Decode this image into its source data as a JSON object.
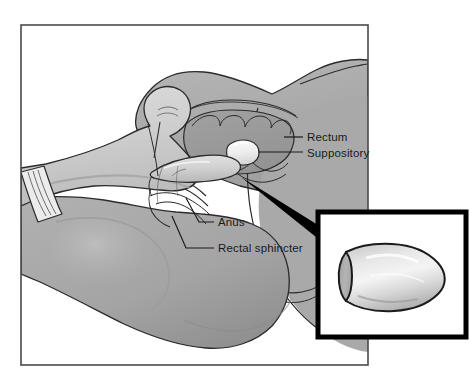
{
  "figure": {
    "type": "medical-illustration",
    "frame": {
      "border_color": "#4a4a4a",
      "background": "#ffffff"
    },
    "colors": {
      "skin_mid": "#a8a8a8",
      "skin_light": "#c3c3c3",
      "skin_dark": "#949494",
      "skin_shadow": "#8d8d8d",
      "glove_light": "#d7d7d7",
      "glove_mid": "#c6c6c6",
      "glove_shade": "#b4b4b4",
      "suppository_white": "#f2f2f2",
      "outline": "#2b2b2b",
      "pointer_wedge": "#000000",
      "inset_border": "#000000",
      "inset_background": "#ffffff",
      "label_text": "#1a1a1a"
    }
  },
  "labels": [
    {
      "id": "rectum",
      "text": "Rectum",
      "text_x": 307,
      "text_y": 141,
      "leader_x1": 284,
      "leader_y1": 137,
      "leader_x2": 303,
      "leader_y2": 137
    },
    {
      "id": "suppository",
      "text": "Suppository",
      "text_x": 307,
      "text_y": 157,
      "leader_x1": 256,
      "leader_y1": 152,
      "leader_x2": 303,
      "leader_y2": 152
    },
    {
      "id": "anus",
      "text": "Anus",
      "text_x": 218,
      "text_y": 226,
      "leader_x1": 186,
      "leader_y1": 198,
      "leader_x2": 214,
      "leader_y2": 222
    },
    {
      "id": "rectal-sphincter",
      "text": "Rectal sphincter",
      "text_x": 218,
      "text_y": 252,
      "leader_x1": 172,
      "leader_y1": 216,
      "leader_x2": 214,
      "leader_y2": 248
    }
  ],
  "inset": {
    "name": "suppository-closeup",
    "x": 318,
    "y": 212,
    "width": 148,
    "height": 125,
    "border_width": 5,
    "description": "Close-up of a bullet-shaped suppository, flat elliptical base at left, rounded tip at right"
  },
  "pointer": {
    "name": "inset-pointer-wedge",
    "from_x": 241,
    "from_y": 177,
    "to_x": 322,
    "to_y": 232,
    "description": "Tapered black wedge connecting anal region to close-up inset"
  },
  "scene_parts": [
    {
      "id": "upper-buttock",
      "label": "Upper buttock / hip"
    },
    {
      "id": "lower-buttock",
      "label": "Lower buttock / thigh"
    },
    {
      "id": "gloved-hand",
      "label": "Gloved hand"
    },
    {
      "id": "glove-cuff",
      "label": "Glove cuff"
    },
    {
      "id": "index-finger",
      "label": "Index finger inserting suppository"
    },
    {
      "id": "rectal-cavity",
      "label": "Rectal cavity with mucosal folds"
    },
    {
      "id": "suppository-body",
      "label": "Suppository in rectum"
    },
    {
      "id": "anal-canal",
      "label": "Anal canal"
    }
  ]
}
